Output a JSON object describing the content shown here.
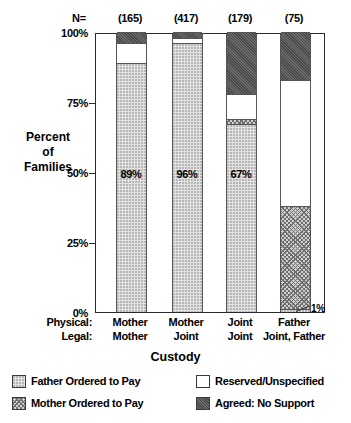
{
  "chart_data": {
    "type": "bar",
    "subtype": "stacked-percentage",
    "title": "",
    "xlabel": "Custody",
    "ylabel": "Percent of Families",
    "ylim": [
      0,
      100
    ],
    "yticks": [
      0,
      25,
      50,
      75,
      100
    ],
    "ytick_labels": [
      "0%",
      "25%",
      "50%",
      "75%",
      "100%"
    ],
    "grid": false,
    "legend_position": "bottom",
    "n_header_label": "N=",
    "categories": [
      "Mother / Mother",
      "Mother / Joint",
      "Joint / Joint",
      "Father / Joint, Father"
    ],
    "category_rows": [
      {
        "key": "Physical:",
        "values": [
          "Mother",
          "Mother",
          "Joint",
          "Father"
        ]
      },
      {
        "key": "Legal:",
        "values": [
          "Mother",
          "Joint",
          "Joint",
          "Joint, Father"
        ]
      }
    ],
    "sample_sizes": [
      "(165)",
      "(417)",
      "(179)",
      "(75)"
    ],
    "sample_sizes_numeric": [
      165,
      417,
      179,
      75
    ],
    "series": [
      {
        "name": "Father Ordered to Pay",
        "key": "father",
        "values": [
          89,
          96,
          67,
          1
        ]
      },
      {
        "name": "Mother Ordered to Pay",
        "key": "mother",
        "values": [
          0,
          0,
          2,
          37
        ]
      },
      {
        "name": "Reserved/Unspecified",
        "key": "reserved",
        "values": [
          7,
          2,
          9,
          45
        ]
      },
      {
        "name": "Agreed:  No Support",
        "key": "agreed",
        "values": [
          4,
          2,
          22,
          17
        ]
      }
    ],
    "bar_value_labels": [
      "89%",
      "96%",
      "67%",
      ""
    ],
    "annotations": [
      {
        "text": "1%",
        "bar": 3,
        "series": "father",
        "value": 1
      }
    ],
    "legend": [
      {
        "label": "Father Ordered to Pay",
        "key": "father"
      },
      {
        "label": "Reserved/Unspecified",
        "key": "reserved"
      },
      {
        "label": "Mother Ordered to Pay",
        "key": "mother"
      },
      {
        "label": "Agreed:  No Support",
        "key": "agreed"
      }
    ],
    "colors": {
      "father": "#e2e2e2",
      "mother": "#cfcfcf",
      "reserved": "#ffffff",
      "agreed": "#6b6b6b",
      "axis": "#2b2b2b",
      "text": "#000000"
    }
  },
  "axis": {
    "ylabel_line1": "Percent",
    "ylabel_line2": "of",
    "ylabel_line3": "Families",
    "xtitle": "Custody"
  }
}
